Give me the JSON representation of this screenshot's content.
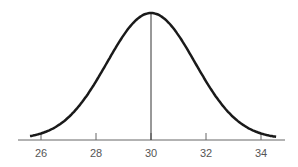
{
  "chart_data": {
    "type": "line",
    "title": "",
    "xlabel": "",
    "ylabel": "",
    "mean": 30,
    "sd": 1.6,
    "x_ticks": [
      26,
      28,
      30,
      32,
      34
    ],
    "x_tick_labels": [
      "26",
      "28",
      "30",
      "32",
      "34"
    ],
    "xlim": [
      25.5,
      34.7
    ],
    "y_axis_visible": false,
    "grid": false,
    "series": [
      {
        "name": "normal-curve",
        "x": [
          25.5,
          26,
          27,
          28,
          29,
          30,
          31,
          32,
          33,
          34,
          34.5
        ],
        "y": [
          0.02,
          0.04,
          0.17,
          0.46,
          0.82,
          1.0,
          0.82,
          0.46,
          0.17,
          0.04,
          0.02
        ]
      }
    ],
    "annotations": [
      {
        "type": "vertical-line",
        "x": 30,
        "label": ""
      }
    ],
    "colors": {
      "curve": "#1a1a1a",
      "axis": "#666666",
      "mean_line": "#333333"
    }
  }
}
